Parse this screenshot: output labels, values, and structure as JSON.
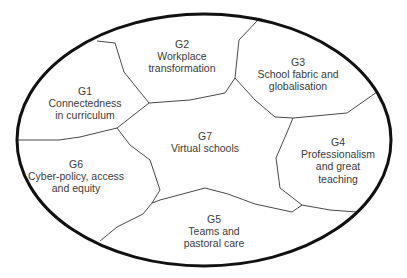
{
  "diagram": {
    "title": "",
    "ellipse": {
      "cx": 204,
      "cy": 140,
      "rx": 187,
      "ry": 126,
      "stroke": "#111111",
      "stroke_width": 3
    },
    "boundary_color": "#333333",
    "text_color": "#3a3a3a",
    "regions": [
      {
        "id": "G1",
        "code": "G1",
        "lines": [
          "Connectedness",
          "in curriculum"
        ],
        "x": 85,
        "y": 85
      },
      {
        "id": "G2",
        "code": "G2",
        "lines": [
          "Workplace",
          "transformation"
        ],
        "x": 182,
        "y": 38
      },
      {
        "id": "G3",
        "code": "G3",
        "lines": [
          "School fabric and",
          "globalisation"
        ],
        "x": 298,
        "y": 56
      },
      {
        "id": "G4",
        "code": "G4",
        "lines": [
          "Professionalism",
          "and great",
          "teaching"
        ],
        "x": 338,
        "y": 136
      },
      {
        "id": "G5",
        "code": "G5",
        "lines": [
          "Teams and",
          "pastoral care"
        ],
        "x": 214,
        "y": 213
      },
      {
        "id": "G6",
        "code": "G6",
        "lines": [
          "Cyber-policy, access",
          "and equity"
        ],
        "x": 76,
        "y": 158
      },
      {
        "id": "G7",
        "code": "G7",
        "lines": [
          "Virtual schools"
        ],
        "x": 205,
        "y": 130
      }
    ],
    "boundaries": [
      {
        "name": "g1-g2",
        "points": "97,41 115,43 124,72 149,103"
      },
      {
        "name": "g2-g7",
        "points": "149,103 190,100 225,93 235,78"
      },
      {
        "name": "g2-g3",
        "points": "235,78 239,40 258,20"
      },
      {
        "name": "g3-g7",
        "points": "235,78 255,100 275,117 293,118"
      },
      {
        "name": "g3-g4",
        "points": "293,118 347,113 377,92"
      },
      {
        "name": "g4-g7",
        "points": "293,118 288,130 276,158 280,188 302,205"
      },
      {
        "name": "g4-g5",
        "points": "302,205 330,210 357,212"
      },
      {
        "name": "g5-g7",
        "points": "302,205 292,212 255,204 228,194 205,188 160,200 152,203"
      },
      {
        "name": "g5-g6",
        "points": "152,203 143,214 117,227 100,241"
      },
      {
        "name": "g6-g7",
        "points": "152,203 160,190 150,160 130,145 117,128"
      },
      {
        "name": "g1-g7",
        "points": "117,128 149,103"
      },
      {
        "name": "g1-g6",
        "points": "117,128 80,137 59,140 17,140"
      }
    ]
  }
}
